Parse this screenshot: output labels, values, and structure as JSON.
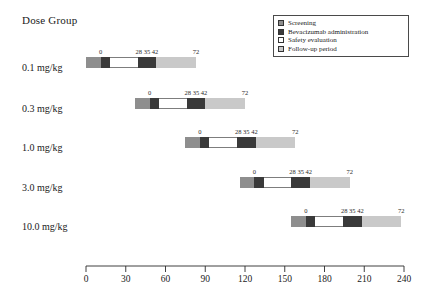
{
  "title": "Dose Group",
  "legend": {
    "items": [
      {
        "label": "Screening",
        "swatch": "screening-swatch-icon",
        "color": "#8e8e8e"
      },
      {
        "label": "Bevacizumab administration",
        "swatch": "administration-swatch-icon",
        "color": "#3a3a3a"
      },
      {
        "label": "Safety evaluation",
        "swatch": "safety-evaluation-swatch-icon",
        "color": "#ffffff"
      },
      {
        "label": "Follow-up period",
        "swatch": "follow-up-swatch-icon",
        "color": "#c9c9c9"
      }
    ]
  },
  "axis": {
    "label": "",
    "min": 0,
    "max": 240,
    "ticks": [
      0,
      30,
      60,
      90,
      120,
      150,
      180,
      210,
      240
    ],
    "tick_labels": [
      "0",
      "30",
      "60",
      "90",
      "120",
      "150",
      "180",
      "210",
      "240"
    ]
  },
  "rows": [
    {
      "label": "0.1 mg/kg",
      "offset": 11,
      "marks": [
        "0",
        "28 35 42",
        "72"
      ]
    },
    {
      "label": "0.3 mg/kg",
      "offset": 48,
      "marks": [
        "0",
        "28 35 42",
        "72"
      ]
    },
    {
      "label": "1.0 mg/kg",
      "offset": 86,
      "marks": [
        "0",
        "28 35 42",
        "72"
      ]
    },
    {
      "label": "3.0 mg/kg",
      "offset": 127,
      "marks": [
        "0",
        "28 35 42",
        "72"
      ]
    },
    {
      "label": "10.0 mg/kg",
      "offset": 166,
      "marks": [
        "0",
        "28 35 42",
        "72"
      ]
    }
  ],
  "chart_data": {
    "type": "bar",
    "subtype": "gantt-timeline",
    "title": "Dose Group",
    "xlabel": "",
    "ylabel": "Dose Group",
    "xlim": [
      0,
      240
    ],
    "xticks": [
      0,
      30,
      60,
      90,
      120,
      150,
      180,
      210,
      240
    ],
    "grid": false,
    "legend_position": "top-right",
    "categories": [
      "0.1 mg/kg",
      "0.3 mg/kg",
      "1.0 mg/kg",
      "3.0 mg/kg",
      "10.0 mg/kg"
    ],
    "phases": [
      {
        "name": "Screening",
        "start_day": -11,
        "end_day": 0,
        "color": "#8e8e8e"
      },
      {
        "name": "Bevacizumab administration",
        "start_day": 0,
        "end_day": 7,
        "color": "#3a3a3a"
      },
      {
        "name": "Safety evaluation",
        "start_day": 7,
        "end_day": 28,
        "color": "#ffffff"
      },
      {
        "name": "Bevacizumab administration",
        "start_day": 28,
        "end_day": 42,
        "color": "#3a3a3a"
      },
      {
        "name": "Follow-up period",
        "start_day": 42,
        "end_day": 72,
        "color": "#c9c9c9"
      }
    ],
    "series": [
      {
        "name": "0.1 mg/kg",
        "start_offset": 11,
        "bar_start": 0,
        "bar_end": 83,
        "day_markers": [
          0,
          28,
          35,
          42,
          72
        ]
      },
      {
        "name": "0.3 mg/kg",
        "start_offset": 48,
        "bar_start": 37,
        "bar_end": 120,
        "day_markers": [
          0,
          28,
          35,
          42,
          72
        ]
      },
      {
        "name": "1.0 mg/kg",
        "start_offset": 86,
        "bar_start": 75,
        "bar_end": 158,
        "day_markers": [
          0,
          28,
          35,
          42,
          72
        ]
      },
      {
        "name": "3.0 mg/kg",
        "start_offset": 127,
        "bar_start": 116,
        "bar_end": 199,
        "day_markers": [
          0,
          28,
          35,
          42,
          72
        ]
      },
      {
        "name": "10.0 mg/kg",
        "start_offset": 166,
        "bar_start": 155,
        "bar_end": 238,
        "day_markers": [
          0,
          28,
          35,
          42,
          72
        ]
      }
    ]
  }
}
